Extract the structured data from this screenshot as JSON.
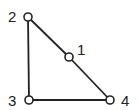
{
  "diagram": {
    "type": "graph",
    "line_color": "#222222",
    "nodes": [
      {
        "id": "1",
        "label": "1",
        "x": 69,
        "y": 57,
        "label_x": 77,
        "label_y": 55
      },
      {
        "id": "2",
        "label": "2",
        "x": 28,
        "y": 17,
        "label_x": 8,
        "label_y": 22
      },
      {
        "id": "3",
        "label": "3",
        "x": 29,
        "y": 100,
        "label_x": 8,
        "label_y": 106
      },
      {
        "id": "4",
        "label": "4",
        "x": 110,
        "y": 100,
        "label_x": 121,
        "label_y": 106
      }
    ],
    "edges": [
      {
        "from": "2",
        "to": "1"
      },
      {
        "from": "1",
        "to": "4"
      },
      {
        "from": "2",
        "to": "3"
      },
      {
        "from": "3",
        "to": "4"
      }
    ]
  }
}
